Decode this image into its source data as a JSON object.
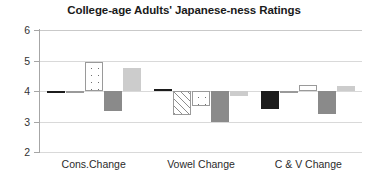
{
  "chart_data": {
    "type": "bar",
    "title": "College-age Adults' Japanese-ness Ratings",
    "xlabel": "",
    "ylabel": "",
    "ylim": [
      2,
      6
    ],
    "yticks": [
      2,
      3,
      4,
      5,
      6
    ],
    "baseline": 4,
    "grid": true,
    "legend": "none",
    "categories": [
      "Cons.Change",
      "Vowel Change",
      "C & V Change"
    ],
    "series": [
      {
        "name": "Series 1",
        "style": "solid-black",
        "color": "#1c1c1c",
        "values": [
          3.95,
          4.05,
          3.4
        ]
      },
      {
        "name": "Series 2",
        "style": "diagonal-hatch",
        "color": "#ffffff",
        "values": [
          3.92,
          3.2,
          4.0
        ]
      },
      {
        "name": "Series 3",
        "style": "dotted",
        "color": "#ffffff",
        "values": [
          4.95,
          3.5,
          4.2
        ]
      },
      {
        "name": "Series 4",
        "style": "solid-gray",
        "color": "#8a8a8a",
        "values": [
          3.35,
          3.0,
          3.25
        ]
      },
      {
        "name": "Series 5",
        "style": "solid-lightgray",
        "color": "#cccccc",
        "values": [
          4.75,
          3.85,
          4.15
        ]
      }
    ]
  },
  "axis": {
    "y_tick_labels": [
      "6",
      "5",
      "4",
      "3",
      "2"
    ]
  }
}
